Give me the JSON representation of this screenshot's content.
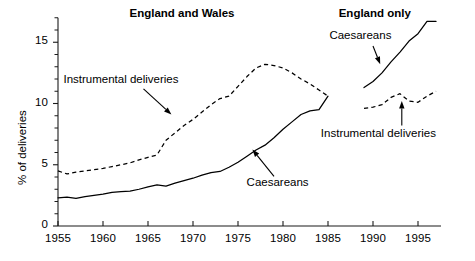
{
  "chart_data": {
    "type": "line",
    "title": "",
    "xlabel": "",
    "ylabel": "% of deliveries",
    "xlim": [
      1955,
      1997
    ],
    "ylim": [
      0,
      17
    ],
    "grid": false,
    "legend_position": "inline-annotations",
    "y_ticks": [
      "0",
      "5",
      "10",
      "15"
    ],
    "y_tick_values": [
      0,
      5,
      10,
      15
    ],
    "y_minor_step": 1,
    "x_ticks": [
      "1955",
      "1960",
      "1965",
      "1970",
      "1975",
      "1980",
      "1985",
      "1990",
      "1995"
    ],
    "x_tick_values": [
      1955,
      1960,
      1965,
      1970,
      1975,
      1980,
      1985,
      1990,
      1995
    ],
    "panels": [
      {
        "name": "england-and-wales",
        "title": "England and Wales",
        "title_x": 1968.5,
        "title_y": 17.2
      },
      {
        "name": "england-only",
        "title": "England only",
        "title_x": 1990.2,
        "title_y": 17.2
      }
    ],
    "series": [
      {
        "name": "Caesareans (England and Wales)",
        "panel": "england-and-wales",
        "style": "solid",
        "label": "Caesareans",
        "label_x": 1979.4,
        "label_y": 3.45,
        "arrow_from_x": 1979.0,
        "arrow_from_y": 4.05,
        "arrow_to_x": 1976.6,
        "arrow_to_y": 6.25,
        "x": [
          1955,
          1956,
          1957,
          1958,
          1959,
          1960,
          1961,
          1962,
          1963,
          1964,
          1965,
          1966,
          1967,
          1968,
          1969,
          1970,
          1971,
          1972,
          1973,
          1974,
          1975,
          1976,
          1977,
          1978,
          1979,
          1980,
          1981,
          1982,
          1983,
          1984,
          1985
        ],
        "y": [
          2.3,
          2.35,
          2.25,
          2.4,
          2.5,
          2.6,
          2.75,
          2.8,
          2.85,
          3.0,
          3.2,
          3.35,
          3.25,
          3.5,
          3.7,
          3.9,
          4.15,
          4.35,
          4.45,
          4.8,
          5.2,
          5.7,
          6.2,
          6.6,
          7.2,
          7.9,
          8.5,
          9.1,
          9.4,
          9.5,
          10.6
        ]
      },
      {
        "name": "Instrumental deliveries (England and Wales)",
        "panel": "england-and-wales",
        "style": "dashed",
        "label": "Instrumental deliveries",
        "label_x": 1962.0,
        "label_y": 11.85,
        "arrow_from_x": 1964.5,
        "arrow_from_y": 11.2,
        "arrow_to_x": 1967.6,
        "arrow_to_y": 9.1,
        "x": [
          1955,
          1956,
          1957,
          1958,
          1959,
          1960,
          1961,
          1962,
          1963,
          1964,
          1965,
          1966,
          1967,
          1968,
          1969,
          1970,
          1971,
          1972,
          1973,
          1974,
          1975,
          1976,
          1977,
          1978,
          1979,
          1980,
          1981,
          1982,
          1983,
          1984,
          1985
        ],
        "y": [
          4.5,
          4.25,
          4.4,
          4.5,
          4.6,
          4.7,
          4.85,
          5.0,
          5.15,
          5.4,
          5.6,
          5.8,
          7.0,
          7.6,
          8.2,
          8.7,
          9.3,
          9.9,
          10.4,
          10.6,
          11.4,
          12.2,
          12.9,
          13.2,
          13.1,
          12.9,
          12.5,
          12.0,
          11.6,
          11.1,
          10.6
        ]
      },
      {
        "name": "Caesareans (England only)",
        "panel": "england-only",
        "style": "solid",
        "label": "Caesareans",
        "label_x": 1988.6,
        "label_y": 15.4,
        "arrow_from_x": 1990.0,
        "arrow_from_y": 14.7,
        "arrow_to_x": 1990.8,
        "arrow_to_y": 13.2,
        "x": [
          1989,
          1990,
          1991,
          1992,
          1993,
          1994,
          1995,
          1996,
          1997
        ],
        "y": [
          11.3,
          11.8,
          12.5,
          13.4,
          14.2,
          15.1,
          15.7,
          16.7,
          16.7
        ]
      },
      {
        "name": "Instrumental deliveries (England only)",
        "panel": "england-only",
        "style": "dashed",
        "label": "Instrumental deliveries",
        "label_x": 1990.6,
        "label_y": 7.4,
        "arrow_from_x": 1993.2,
        "arrow_from_y": 8.2,
        "arrow_to_x": 1993.2,
        "arrow_to_y": 10.2,
        "x": [
          1989,
          1990,
          1991,
          1992,
          1993,
          1994,
          1995,
          1996,
          1997
        ],
        "y": [
          9.6,
          9.7,
          9.9,
          10.5,
          10.8,
          10.2,
          10.1,
          10.6,
          11.0
        ]
      }
    ]
  },
  "axis": {
    "y_title": "% of deliveries"
  }
}
